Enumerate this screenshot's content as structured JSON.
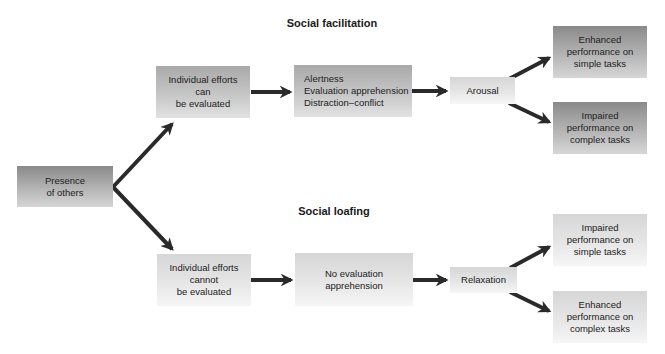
{
  "diagram": {
    "colors": {
      "arrow": "#2a2a2a",
      "box_dark_top": "#8a8a8a",
      "box_light_top": "#d6d6d6",
      "text": "#222222"
    },
    "titles": {
      "facilitation": "Social facilitation",
      "loafing": "Social loafing"
    },
    "root": {
      "lines": [
        "Presence",
        "of others"
      ]
    },
    "facilitation": {
      "evaluated": {
        "lines": [
          "Individual efforts",
          "can",
          "be evaluated"
        ]
      },
      "mechanisms": {
        "lines": [
          "Alertness",
          "Evaluation apprehension",
          "Distraction–conflict"
        ]
      },
      "state": {
        "lines": [
          "Arousal"
        ]
      },
      "outcome_simple": {
        "lines": [
          "Enhanced",
          "performance on",
          "simple tasks"
        ]
      },
      "outcome_complex": {
        "lines": [
          "Impaired",
          "performance on",
          "complex tasks"
        ]
      }
    },
    "loafing": {
      "evaluated": {
        "lines": [
          "Individual efforts",
          "cannot",
          "be evaluated"
        ]
      },
      "mechanisms": {
        "lines": [
          "No evaluation",
          "apprehension"
        ]
      },
      "state": {
        "lines": [
          "Relaxation"
        ]
      },
      "outcome_simple": {
        "lines": [
          "Impaired",
          "performance on",
          "simple tasks"
        ]
      },
      "outcome_complex": {
        "lines": [
          "Enhanced",
          "performance on",
          "complex tasks"
        ]
      }
    }
  }
}
